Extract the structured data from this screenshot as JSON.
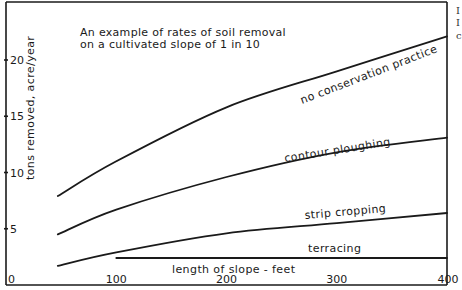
{
  "chart_data": {
    "type": "line",
    "title": "An example of rates of soil removal on a cultivated slope of 1 in 10",
    "title_lines": [
      "An example of rates of soil removal",
      "on a cultivated slope of 1 in 10"
    ],
    "xlabel": "length of slope - feet",
    "ylabel": "tons removed, acre/year",
    "xlim": [
      0,
      400
    ],
    "ylim": [
      0,
      23
    ],
    "x_ticks": [
      0,
      100,
      200,
      300,
      400
    ],
    "x_tick_labels": [
      "0",
      "100",
      "200",
      "300",
      "400"
    ],
    "y_ticks": [
      5,
      10,
      15,
      20
    ],
    "y_tick_labels": [
      "5",
      "10",
      "15",
      "20"
    ],
    "grid": false,
    "legend": "inline labels on curves",
    "series": [
      {
        "name": "no conservation practice",
        "x": [
          47,
          100,
          200,
          300,
          400
        ],
        "values": [
          7.9,
          11.0,
          15.8,
          19.0,
          22.1
        ]
      },
      {
        "name": "contour ploughing",
        "x": [
          47,
          100,
          200,
          300,
          400
        ],
        "values": [
          4.5,
          6.7,
          9.6,
          11.8,
          13.1
        ]
      },
      {
        "name": "strip cropping",
        "x": [
          47,
          100,
          200,
          300,
          400
        ],
        "values": [
          1.7,
          2.9,
          4.6,
          5.5,
          6.4
        ]
      },
      {
        "name": "terracing",
        "x": [
          100,
          400
        ],
        "values": [
          2.4,
          2.4
        ]
      }
    ]
  },
  "edge_fragments": [
    "I",
    "I",
    "c"
  ]
}
